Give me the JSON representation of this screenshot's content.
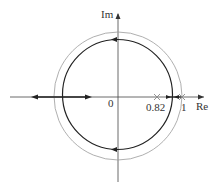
{
  "diagram": {
    "type": "root-locus",
    "axes": {
      "real_label": "Re",
      "imag_label": "Im",
      "origin_label": "0"
    },
    "unit_circle": {
      "radius": 1,
      "color": "#9a9a9a"
    },
    "locus_circle": {
      "color": "#222222"
    },
    "poles": [
      {
        "value": 0.82,
        "label": "0.82"
      },
      {
        "value": 1,
        "label": "1"
      }
    ],
    "colors": {
      "axis": "#444444",
      "locus": "#222222",
      "unit_circle": "#9a9a9a",
      "pole_mark": "#888888"
    }
  }
}
